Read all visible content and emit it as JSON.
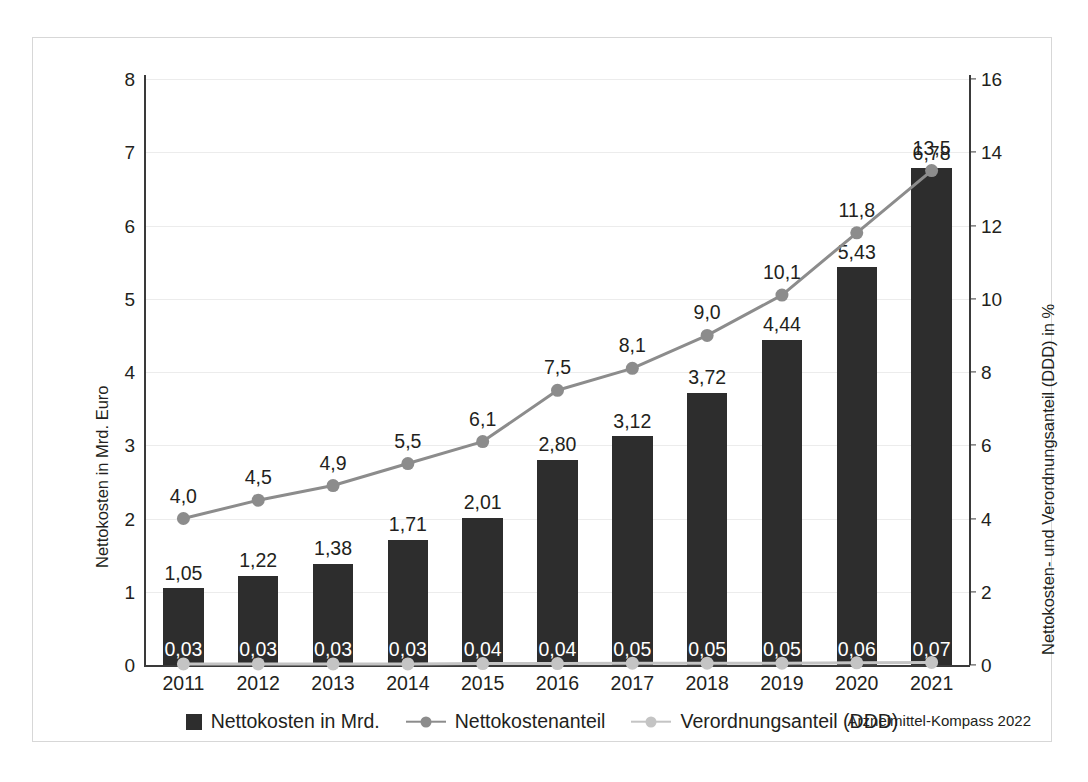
{
  "figure": {
    "source_note": "Arzneimittel-Kompass 2022"
  },
  "axes": {
    "left_title": "Nettokosten in Mrd. Euro",
    "right_title": "Nettokosten- und Verordnungsanteil (DDD) in %",
    "left_ticks": [
      "0",
      "1",
      "2",
      "3",
      "4",
      "5",
      "6",
      "7",
      "8"
    ],
    "right_ticks": [
      "0",
      "2",
      "4",
      "6",
      "8",
      "10",
      "12",
      "14",
      "16"
    ]
  },
  "legend": {
    "items": [
      {
        "label": "Nettokosten in Mrd.",
        "marker": "square-swatch",
        "color": "#2d2d2d"
      },
      {
        "label": "Nettokostenanteil",
        "marker": "line-dot-marker",
        "color": "#8c8c8c"
      },
      {
        "label": "Verordnungsanteil (DDD)",
        "marker": "line-dot-marker",
        "color": "#c4c4c4"
      }
    ]
  },
  "chart_data": {
    "type": "bar",
    "title": "",
    "xlabel": "",
    "ylabel": "Nettokosten in Mrd. Euro",
    "y2label": "Nettokosten- und Verordnungsanteil (DDD) in %",
    "ylim": [
      0,
      8
    ],
    "y2lim": [
      0,
      16
    ],
    "grid": true,
    "legend_position": "bottom",
    "categories": [
      "2011",
      "2012",
      "2013",
      "2014",
      "2015",
      "2016",
      "2017",
      "2018",
      "2019",
      "2020",
      "2021"
    ],
    "series": [
      {
        "name": "Nettokosten in Mrd.",
        "kind": "bar",
        "axis": "left",
        "color": "#2d2d2d",
        "values": [
          1.05,
          1.22,
          1.38,
          1.71,
          2.01,
          2.8,
          3.12,
          3.72,
          4.44,
          5.43,
          6.78
        ],
        "labels": [
          "1,05",
          "1,22",
          "1,38",
          "1,71",
          "2,01",
          "2,80",
          "3,12",
          "3,72",
          "4,44",
          "5,43",
          "6,78"
        ]
      },
      {
        "name": "Nettokostenanteil",
        "kind": "line",
        "axis": "right",
        "color": "#8c8c8c",
        "values": [
          4.0,
          4.5,
          4.9,
          5.5,
          6.1,
          7.5,
          8.1,
          9.0,
          10.1,
          11.8,
          13.5
        ],
        "labels": [
          "4,0",
          "4,5",
          "4,9",
          "5,5",
          "6,1",
          "7,5",
          "8,1",
          "9,0",
          "10,1",
          "11,8",
          "13,5"
        ]
      },
      {
        "name": "Verordnungsanteil (DDD)",
        "kind": "line",
        "axis": "right",
        "color": "#c4c4c4",
        "values": [
          0.03,
          0.03,
          0.03,
          0.03,
          0.04,
          0.04,
          0.05,
          0.05,
          0.05,
          0.06,
          0.07
        ],
        "labels": [
          "0,03",
          "0,03",
          "0,03",
          "0,03",
          "0,04",
          "0,04",
          "0,05",
          "0,05",
          "0,05",
          "0,06",
          "0,07"
        ]
      }
    ]
  }
}
